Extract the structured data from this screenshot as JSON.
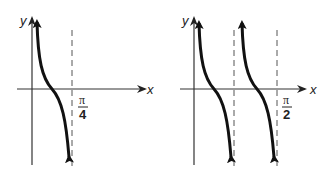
{
  "diagram": {
    "type": "function-graphs",
    "panels": [
      {
        "id": "left",
        "x_label": "x",
        "y_label": "y",
        "asymptote_label_numerator": "π",
        "asymptote_label_denominator": "4",
        "branches": 1
      },
      {
        "id": "right",
        "x_label": "x",
        "y_label": "y",
        "asymptote_label_numerator": "π",
        "asymptote_label_denominator": "2",
        "branches": 2
      }
    ],
    "colors": {
      "curve": "#111111",
      "axis": "#333333",
      "asymptote": "#555555"
    }
  }
}
